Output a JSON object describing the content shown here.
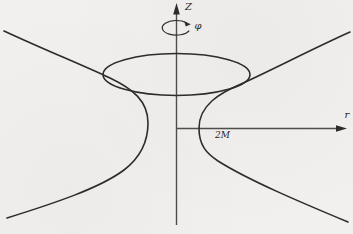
{
  "figure": {
    "name": "schwarzschild-embedding-diagram",
    "labels": {
      "vertical_axis": "Z",
      "azimuthal_angle": "φ",
      "radial_axis": "r",
      "schwarzschild_radius": "2M"
    },
    "colors": {
      "background": "#f1f0ee",
      "curve": "#2e2c2a",
      "axis": "#4f4d4a",
      "text": "#262421"
    }
  }
}
